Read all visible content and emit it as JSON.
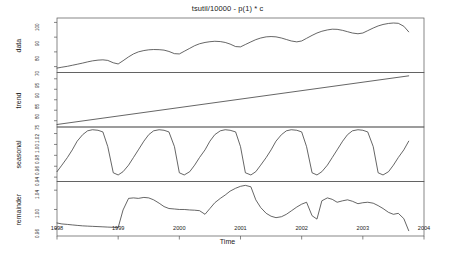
{
  "chart_data": {
    "type": "line",
    "title": "tsutil/10000 - p(1) * c",
    "xlabel": "Time",
    "ylabel": "",
    "grid": false,
    "legend": "none",
    "xlim": [
      1998.0,
      2004.0
    ],
    "xticks": [
      "1998",
      "1999",
      "2000",
      "2001",
      "2002",
      "2003",
      "2004"
    ],
    "xtick_values": [
      1998,
      1999,
      2000,
      2001,
      2002,
      2003,
      2004
    ],
    "panels": [
      {
        "name": "data",
        "label": "data",
        "yticks": [
          "70",
          "80",
          "90",
          "100"
        ],
        "ytick_values": [
          70,
          80,
          90,
          100
        ],
        "ylim": [
          66,
          103
        ],
        "x": [
          1998.0,
          1998.08,
          1998.17,
          1998.25,
          1998.33,
          1998.42,
          1998.5,
          1998.58,
          1998.67,
          1998.75,
          1998.83,
          1998.92,
          1999.0,
          1999.08,
          1999.17,
          1999.25,
          1999.33,
          1999.42,
          1999.5,
          1999.58,
          1999.67,
          1999.75,
          1999.83,
          1999.92,
          2000.0,
          2000.08,
          2000.17,
          2000.25,
          2000.33,
          2000.42,
          2000.5,
          2000.58,
          2000.67,
          2000.75,
          2000.83,
          2000.92,
          2001.0,
          2001.08,
          2001.17,
          2001.25,
          2001.33,
          2001.42,
          2001.5,
          2001.58,
          2001.67,
          2001.75,
          2001.83,
          2001.92,
          2002.0,
          2002.08,
          2002.17,
          2002.25,
          2002.33,
          2002.42,
          2002.5,
          2002.58,
          2002.67,
          2002.75,
          2002.83,
          2002.92,
          2003.0,
          2003.08,
          2003.17,
          2003.25,
          2003.33,
          2003.42,
          2003.5,
          2003.58,
          2003.67,
          2003.75
        ],
        "values": [
          69.0,
          69.6,
          70.2,
          70.9,
          71.6,
          72.4,
          73.2,
          73.9,
          74.4,
          74.6,
          74.2,
          72.6,
          71.8,
          74.0,
          76.6,
          78.6,
          80.0,
          80.9,
          81.4,
          81.6,
          81.5,
          81.2,
          80.3,
          78.8,
          78.6,
          80.4,
          82.4,
          84.2,
          85.5,
          86.4,
          86.9,
          87.2,
          87.0,
          86.4,
          85.3,
          83.6,
          83.4,
          85.0,
          86.8,
          88.3,
          89.4,
          90.2,
          90.4,
          90.2,
          89.4,
          88.4,
          87.4,
          86.8,
          87.4,
          89.2,
          91.2,
          92.8,
          94.0,
          94.9,
          95.4,
          95.3,
          94.6,
          93.7,
          92.8,
          92.3,
          92.8,
          94.4,
          96.2,
          97.6,
          98.6,
          99.3,
          99.6,
          99.4,
          97.4,
          93.6
        ]
      },
      {
        "name": "trend",
        "label": "trend",
        "yticks": [
          "75",
          "80",
          "85",
          "90",
          "95"
        ],
        "ytick_values": [
          75,
          80,
          85,
          90,
          95
        ],
        "ylim": [
          72,
          98
        ],
        "x": [
          1998.0,
          2003.75
        ],
        "values": [
          73.2,
          96.4
        ]
      },
      {
        "name": "seasonal",
        "label": "seasonal",
        "yticks": [
          "0.94",
          "0.96",
          "0.98",
          "1.00",
          "1.02"
        ],
        "ytick_values": [
          0.94,
          0.96,
          0.98,
          1.0,
          1.02
        ],
        "ylim": [
          0.932,
          1.032
        ],
        "x": [
          1998.0,
          1998.08,
          1998.17,
          1998.25,
          1998.33,
          1998.42,
          1998.5,
          1998.58,
          1998.67,
          1998.75,
          1998.83,
          1998.92,
          1999.0,
          1999.08,
          1999.17,
          1999.25,
          1999.33,
          1999.42,
          1999.5,
          1999.58,
          1999.67,
          1999.75,
          1999.83,
          1999.92,
          2000.0,
          2000.08,
          2000.17,
          2000.25,
          2000.33,
          2000.42,
          2000.5,
          2000.58,
          2000.67,
          2000.75,
          2000.83,
          2000.92,
          2001.0,
          2001.08,
          2001.17,
          2001.25,
          2001.33,
          2001.42,
          2001.5,
          2001.58,
          2001.67,
          2001.75,
          2001.83,
          2001.92,
          2002.0,
          2002.08,
          2002.17,
          2002.25,
          2002.33,
          2002.42,
          2002.5,
          2002.58,
          2002.67,
          2002.75,
          2002.83,
          2002.92,
          2003.0,
          2003.08,
          2003.17,
          2003.25,
          2003.33,
          2003.42,
          2003.5,
          2003.58,
          2003.67,
          2003.75
        ],
        "values": [
          0.95,
          0.962,
          0.976,
          0.99,
          1.006,
          1.018,
          1.025,
          1.027,
          1.026,
          1.023,
          0.996,
          0.948,
          0.944,
          0.95,
          0.962,
          0.976,
          0.99,
          1.006,
          1.018,
          1.025,
          1.027,
          1.026,
          1.023,
          0.996,
          0.948,
          0.944,
          0.95,
          0.962,
          0.976,
          0.99,
          1.006,
          1.018,
          1.025,
          1.027,
          1.026,
          1.023,
          0.996,
          0.948,
          0.944,
          0.95,
          0.962,
          0.976,
          0.99,
          1.006,
          1.018,
          1.025,
          1.027,
          1.026,
          1.023,
          0.996,
          0.948,
          0.944,
          0.95,
          0.962,
          0.976,
          0.99,
          1.006,
          1.018,
          1.025,
          1.027,
          1.026,
          1.023,
          0.996,
          0.948,
          0.944,
          0.95,
          0.962,
          0.976,
          0.99,
          1.006
        ]
      },
      {
        "name": "remainder",
        "label": "remainder",
        "yticks": [
          "0.96",
          "1.00",
          "1.04"
        ],
        "ytick_values": [
          0.96,
          1.0,
          1.04
        ],
        "ylim": [
          0.945,
          1.058
        ],
        "x": [
          1998.0,
          1998.08,
          1998.17,
          1998.25,
          1998.33,
          1998.42,
          1998.5,
          1998.58,
          1998.67,
          1998.75,
          1998.83,
          1998.92,
          1999.0,
          1999.08,
          1999.17,
          1999.25,
          1999.33,
          1999.42,
          1999.5,
          1999.58,
          1999.67,
          1999.75,
          1999.83,
          1999.92,
          2000.0,
          2000.08,
          2000.17,
          2000.25,
          2000.33,
          2000.42,
          2000.5,
          2000.58,
          2000.67,
          2000.75,
          2000.83,
          2000.92,
          2001.0,
          2001.08,
          2001.17,
          2001.25,
          2001.33,
          2001.42,
          2001.5,
          2001.58,
          2001.67,
          2001.75,
          2001.83,
          2001.92,
          2002.0,
          2002.08,
          2002.17,
          2002.25,
          2002.33,
          2002.42,
          2002.5,
          2002.58,
          2002.67,
          2002.75,
          2002.83,
          2002.92,
          2003.0,
          2003.08,
          2003.17,
          2003.25,
          2003.33,
          2003.42,
          2003.5,
          2003.58,
          2003.67,
          2003.75
        ],
        "values": [
          0.972,
          0.97,
          0.969,
          0.968,
          0.967,
          0.966,
          0.9655,
          0.965,
          0.9645,
          0.964,
          0.9635,
          0.963,
          0.9625,
          0.999,
          1.023,
          1.024,
          1.023,
          1.025,
          1.024,
          1.02,
          1.013,
          1.006,
          1.002,
          1.001,
          1.0,
          1.0,
          0.999,
          0.9985,
          0.9975,
          0.99,
          1.002,
          1.014,
          1.023,
          1.03,
          1.038,
          1.044,
          1.048,
          1.05,
          1.047,
          1.02,
          1.004,
          0.992,
          0.986,
          0.983,
          0.985,
          0.99,
          0.997,
          1.005,
          1.011,
          1.015,
          0.987,
          0.98,
          1.018,
          1.024,
          1.021,
          1.015,
          1.018,
          1.02,
          1.017,
          1.012,
          1.014,
          1.015,
          1.013,
          1.008,
          1.002,
          0.994,
          0.99,
          0.992,
          0.981,
          0.956
        ]
      }
    ]
  }
}
